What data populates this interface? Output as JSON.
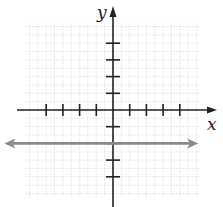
{
  "chart_data": {
    "type": "line",
    "title": "",
    "xlabel": "x",
    "ylabel": "y",
    "xlim": [
      -5,
      5
    ],
    "ylim": [
      -5,
      5
    ],
    "x_ticks": [
      -4,
      -3,
      -2,
      -1,
      1,
      2,
      3,
      4
    ],
    "y_ticks": [
      -4,
      -3,
      -2,
      -1,
      1,
      2,
      3,
      4
    ],
    "tick_labels_shown": false,
    "grid": true,
    "series": [
      {
        "name": "y = -2",
        "kind": "horizontal-line-with-arrows",
        "equation": "y = -2",
        "x": [
          -6.5,
          5.1
        ],
        "y": [
          -2,
          -2
        ],
        "color": "#8a8a8a"
      }
    ]
  },
  "colors": {
    "axis": "#222222",
    "grid": "#d9d9d9",
    "line": "#8a8a8a"
  }
}
